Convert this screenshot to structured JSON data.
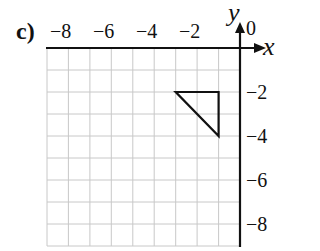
{
  "part_label": "c)",
  "axes": {
    "x_label": "x",
    "y_label": "y",
    "origin_label": "0",
    "x_ticks": [
      "−8",
      "−6",
      "−4",
      "−2"
    ],
    "y_ticks": [
      "−2",
      "−4",
      "−6",
      "−8"
    ]
  },
  "grid": {
    "x_range": [
      -9,
      0
    ],
    "y_range": [
      -9,
      0
    ],
    "step": 1
  },
  "shape": {
    "type": "triangle",
    "vertices": [
      [
        -3,
        -2
      ],
      [
        -1,
        -2
      ],
      [
        -1,
        -4
      ]
    ]
  },
  "colors": {
    "grid": "#c8c8c8",
    "axis": "#111111",
    "shape": "#111111"
  }
}
